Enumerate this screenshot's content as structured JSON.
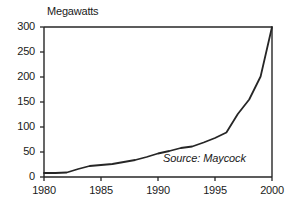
{
  "chart_data": {
    "type": "line",
    "title": "",
    "ylabel": "Megawatts",
    "xlabel": "",
    "xlim": [
      1980,
      2000
    ],
    "ylim": [
      0,
      300
    ],
    "grid": false,
    "legend": null,
    "annotations": [
      {
        "name": "source",
        "text": "Source: Maycock"
      }
    ],
    "y_ticks": [
      0,
      50,
      100,
      150,
      200,
      250,
      300
    ],
    "y_tick_labels": [
      "0",
      "50",
      "100",
      "150",
      "200",
      "250",
      "300"
    ],
    "x_ticks": [
      1980,
      1985,
      1990,
      1995,
      2000
    ],
    "x_tick_labels": [
      "1980",
      "1985",
      "1990",
      "1995",
      "2000"
    ],
    "series": [
      {
        "name": "World Photovoltaic Shipments",
        "color": "#262626",
        "x": [
          1980,
          1981,
          1982,
          1983,
          1984,
          1985,
          1986,
          1987,
          1988,
          1989,
          1990,
          1991,
          1992,
          1993,
          1994,
          1995,
          1996,
          1997,
          1998,
          1999,
          2000
        ],
        "y": [
          8,
          8,
          9,
          16,
          22,
          24,
          26,
          30,
          34,
          40,
          47,
          52,
          58,
          61,
          69,
          78,
          89,
          126,
          155,
          201,
          300
        ]
      }
    ]
  },
  "labels": {
    "y_title": "Megawatts",
    "source": "Source: Maycock"
  },
  "caption": {
    "text": ""
  },
  "colors": {
    "line": "#262626",
    "frame": "#262626",
    "text": "#1a1a1a",
    "background": "#ffffff"
  }
}
